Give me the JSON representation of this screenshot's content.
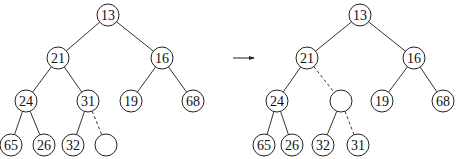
{
  "diagram": {
    "title": "",
    "node_radius": 11,
    "trees": [
      {
        "name": "before",
        "nodes": [
          {
            "id": "a13",
            "label": "13",
            "x": 108,
            "y": 15
          },
          {
            "id": "a21",
            "label": "21",
            "x": 58,
            "y": 58
          },
          {
            "id": "a16",
            "label": "16",
            "x": 162,
            "y": 58
          },
          {
            "id": "a24",
            "label": "24",
            "x": 26,
            "y": 101
          },
          {
            "id": "a31",
            "label": "31",
            "x": 88,
            "y": 101
          },
          {
            "id": "a19",
            "label": "19",
            "x": 131,
            "y": 101
          },
          {
            "id": "a68",
            "label": "68",
            "x": 193,
            "y": 101
          },
          {
            "id": "a65",
            "label": "65",
            "x": 11,
            "y": 145
          },
          {
            "id": "a26",
            "label": "26",
            "x": 44,
            "y": 145
          },
          {
            "id": "a32",
            "label": "32",
            "x": 73,
            "y": 145
          },
          {
            "id": "aHole",
            "label": "",
            "x": 106,
            "y": 145
          }
        ],
        "edges": [
          {
            "from": "a13",
            "to": "a21",
            "dashed": false
          },
          {
            "from": "a13",
            "to": "a16",
            "dashed": false
          },
          {
            "from": "a21",
            "to": "a24",
            "dashed": false
          },
          {
            "from": "a21",
            "to": "a31",
            "dashed": false
          },
          {
            "from": "a16",
            "to": "a19",
            "dashed": false
          },
          {
            "from": "a16",
            "to": "a68",
            "dashed": false
          },
          {
            "from": "a24",
            "to": "a65",
            "dashed": false
          },
          {
            "from": "a24",
            "to": "a26",
            "dashed": false
          },
          {
            "from": "a31",
            "to": "a32",
            "dashed": false
          },
          {
            "from": "a31",
            "to": "aHole",
            "dashed": true
          }
        ]
      },
      {
        "name": "after",
        "nodes": [
          {
            "id": "b13",
            "label": "13",
            "x": 360,
            "y": 15
          },
          {
            "id": "b21",
            "label": "21",
            "x": 307,
            "y": 58
          },
          {
            "id": "b16",
            "label": "16",
            "x": 414,
            "y": 58
          },
          {
            "id": "b24",
            "label": "24",
            "x": 277,
            "y": 101
          },
          {
            "id": "bHole",
            "label": "",
            "x": 341,
            "y": 101
          },
          {
            "id": "b19",
            "label": "19",
            "x": 382,
            "y": 101
          },
          {
            "id": "b68",
            "label": "68",
            "x": 443,
            "y": 101
          },
          {
            "id": "b65",
            "label": "65",
            "x": 264,
            "y": 145
          },
          {
            "id": "b26",
            "label": "26",
            "x": 292,
            "y": 145
          },
          {
            "id": "b32",
            "label": "32",
            "x": 323,
            "y": 145
          },
          {
            "id": "b31",
            "label": "31",
            "x": 358,
            "y": 145
          }
        ],
        "edges": [
          {
            "from": "b13",
            "to": "b21",
            "dashed": false
          },
          {
            "from": "b13",
            "to": "b16",
            "dashed": false
          },
          {
            "from": "b21",
            "to": "b24",
            "dashed": false
          },
          {
            "from": "b21",
            "to": "bHole",
            "dashed": true
          },
          {
            "from": "b16",
            "to": "b19",
            "dashed": false
          },
          {
            "from": "b16",
            "to": "b68",
            "dashed": false
          },
          {
            "from": "b24",
            "to": "b65",
            "dashed": false
          },
          {
            "from": "b24",
            "to": "b26",
            "dashed": false
          },
          {
            "from": "bHole",
            "to": "b32",
            "dashed": false
          },
          {
            "from": "bHole",
            "to": "b31",
            "dashed": true
          }
        ]
      }
    ],
    "arrow": {
      "x1": 233,
      "y1": 58,
      "x2": 254,
      "y2": 58
    }
  }
}
